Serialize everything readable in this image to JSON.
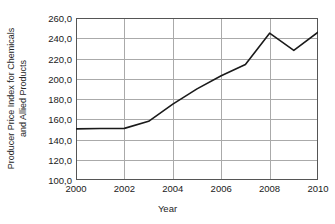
{
  "chart_data": {
    "type": "line",
    "title": "",
    "xlabel": "Year",
    "ylabel": "Producer Price Index for Chemicals and Allied Products",
    "ylabel_line1": "Producer Price Index for Chemicals",
    "ylabel_line2": "and Allied Products",
    "x": [
      2000,
      2001,
      2002,
      2003,
      2004,
      2005,
      2006,
      2007,
      2008,
      2009,
      2010
    ],
    "values": [
      150.5,
      150.8,
      151.0,
      158.0,
      175.0,
      190.0,
      203.0,
      214.0,
      245.0,
      228.0,
      246.0
    ],
    "series": [
      {
        "name": "Producer Price Index for Chemicals and Allied Products",
        "values": [
          150.5,
          150.8,
          151.0,
          158.0,
          175.0,
          190.0,
          203.0,
          214.0,
          245.0,
          228.0,
          246.0
        ]
      }
    ],
    "xlim": [
      2000,
      2010
    ],
    "ylim": [
      100.0,
      260.0
    ],
    "xticks": [
      2000,
      2002,
      2004,
      2006,
      2008,
      2010
    ],
    "xtick_labels": [
      "2000",
      "2002",
      "2004",
      "2006",
      "2008",
      "2010"
    ],
    "yticks": [
      100.0,
      120.0,
      140.0,
      160.0,
      180.0,
      200.0,
      220.0,
      240.0,
      260.0
    ],
    "ytick_labels": [
      "100,0",
      "120,0",
      "140,0",
      "160,0",
      "180,0",
      "200,0",
      "220,0",
      "240,0",
      "260,0"
    ],
    "grid": {
      "horizontal": true,
      "vertical": true,
      "color": "#aaaaaa"
    },
    "legend": {
      "visible": false,
      "position": "none"
    },
    "line_color": "#1a1a1a",
    "line_width": 1.6,
    "frame_color": "#555555",
    "background_color": "#ffffff",
    "markers": false
  }
}
